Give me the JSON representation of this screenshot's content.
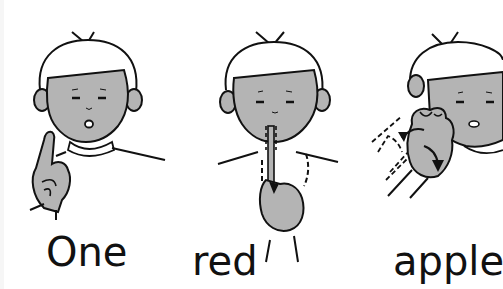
{
  "panels": [
    {
      "word": "One",
      "sign": "index finger raised"
    },
    {
      "word": "red",
      "sign": "index finger stroking down from lips"
    },
    {
      "word": "apple",
      "sign": "knuckle twisting at cheek"
    }
  ],
  "colors": {
    "skin": "#b4b4b4",
    "line": "#111111",
    "background": "#ffffff"
  }
}
